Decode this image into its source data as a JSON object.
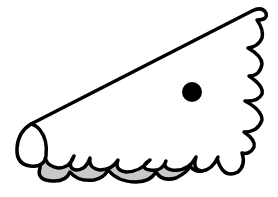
{
  "image": {
    "width": 278,
    "height": 197,
    "background": "#ffffff",
    "description": "Line drawing of a wedge-shaped figure with a straight upper edge, scalloped right and bottom edges, an oval tip at the left, a black dot eye, and gray shaded bumps underneath"
  },
  "colors": {
    "outline": "#000000",
    "fill": "#ffffff",
    "shadow": "#c8c8c8",
    "eye": "#000000"
  },
  "shape": {
    "shadow_path": "M40 168 Q36 180 52 181 Q66 182 70 172 Q78 182 94 180 Q104 178 108 170 Q118 182 136 182 Q150 182 156 172 Q162 182 176 178 Q188 172 190 166 Q196 174 206 170 L208 160 L40 160 Z",
    "body_path": "M31 124 L252 11 Q262 6 266 13 Q268 20 257 20 Q264 30 262 38 Q258 47 248 48 Q262 56 262 64 Q260 76 249 76 Q264 86 262 94 Q258 102 245 101 Q262 110 262 120 Q258 132 244 132 Q256 140 254 147 Q250 155 242 153 Q246 165 238 172 Q226 178 220 166 Q216 158 218 157 Q212 170 202 171 Q192 170 196 157 Q188 172 172 170 Q162 168 166 161 Q162 172 150 170 Q138 168 150 160 Q140 172 126 172 Q114 170 118 160 Q112 170 100 170 Q88 168 90 158 Q86 170 76 170 Q66 168 74 156 Q70 168 58 168 Q48 166 46 160",
    "tip_path": "M31 124 Q18 132 17 148 Q16 164 30 166 Q44 168 46 156 Q48 140 40 130 Q36 125 31 124 Z",
    "eye": {
      "cx": 192,
      "cy": 92,
      "r": 10
    },
    "stroke_width": 3.5
  }
}
